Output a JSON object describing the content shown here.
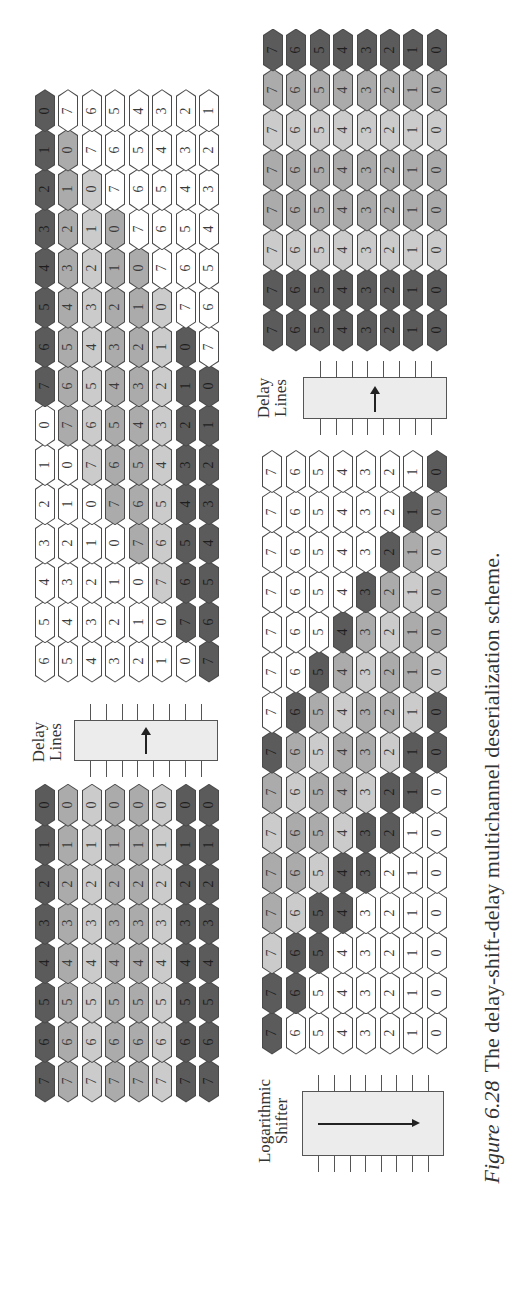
{
  "colors": {
    "dark": "#5b5b5b",
    "mid": "#ababab",
    "light": "#cbcbcb",
    "white": "#ffffff",
    "border": "#4a4a4a",
    "box_fill": "#ececec"
  },
  "labels": {
    "delay_lines_1": [
      "Delay",
      "Lines"
    ],
    "delay_lines_2": [
      "Delay",
      "Lines"
    ],
    "log_shifter": [
      "Logarithmic",
      "Shifter"
    ]
  },
  "caption": {
    "figure_number": "Figure 6.28",
    "text": "The delay-shift-delay multichannel deserialization scheme."
  },
  "chart_data": {
    "type": "diagram",
    "title": "The delay-shift-delay multichannel deserialization scheme.",
    "shade_legend": {
      "d": "dark",
      "m": "medium gray",
      "l": "light gray",
      "w": "white"
    },
    "stages": [
      {
        "name": "input",
        "rows": [
          {
            "values": [
              7,
              6,
              5,
              4,
              3,
              2,
              1,
              0
            ],
            "shades": [
              "d",
              "d",
              "d",
              "d",
              "d",
              "d",
              "d",
              "d"
            ]
          },
          {
            "values": [
              7,
              6,
              5,
              4,
              3,
              2,
              1,
              0
            ],
            "shades": [
              "m",
              "m",
              "m",
              "m",
              "m",
              "m",
              "m",
              "m"
            ]
          },
          {
            "values": [
              7,
              6,
              5,
              4,
              3,
              2,
              1,
              0
            ],
            "shades": [
              "l",
              "l",
              "l",
              "l",
              "l",
              "l",
              "l",
              "l"
            ]
          },
          {
            "values": [
              7,
              6,
              5,
              4,
              3,
              2,
              1,
              0
            ],
            "shades": [
              "m",
              "m",
              "m",
              "m",
              "m",
              "m",
              "m",
              "m"
            ]
          },
          {
            "values": [
              7,
              6,
              5,
              4,
              3,
              2,
              1,
              0
            ],
            "shades": [
              "m",
              "m",
              "m",
              "m",
              "m",
              "m",
              "m",
              "m"
            ]
          },
          {
            "values": [
              7,
              6,
              5,
              4,
              3,
              2,
              1,
              0
            ],
            "shades": [
              "l",
              "l",
              "l",
              "l",
              "l",
              "l",
              "l",
              "l"
            ]
          },
          {
            "values": [
              7,
              6,
              5,
              4,
              3,
              2,
              1,
              0
            ],
            "shades": [
              "d",
              "d",
              "d",
              "d",
              "d",
              "d",
              "d",
              "d"
            ]
          },
          {
            "values": [
              7,
              6,
              5,
              4,
              3,
              2,
              1,
              0
            ],
            "shades": [
              "d",
              "d",
              "d",
              "d",
              "d",
              "d",
              "d",
              "d"
            ]
          }
        ]
      },
      {
        "name": "delay_lines_output",
        "rows": [
          {
            "values": [
              6,
              5,
              4,
              3,
              2,
              1,
              0,
              7,
              6,
              5,
              4,
              3,
              2,
              1,
              0
            ],
            "shades": [
              "w",
              "w",
              "w",
              "w",
              "w",
              "w",
              "w",
              "d",
              "d",
              "d",
              "d",
              "d",
              "d",
              "d",
              "d"
            ]
          },
          {
            "values": [
              5,
              4,
              3,
              2,
              1,
              0,
              7,
              6,
              5,
              4,
              3,
              2,
              1,
              0,
              7
            ],
            "shades": [
              "w",
              "w",
              "w",
              "w",
              "w",
              "w",
              "m",
              "m",
              "m",
              "m",
              "m",
              "m",
              "m",
              "m",
              "w"
            ]
          },
          {
            "values": [
              4,
              3,
              2,
              1,
              0,
              7,
              6,
              5,
              4,
              3,
              2,
              1,
              0,
              7,
              6
            ],
            "shades": [
              "w",
              "w",
              "w",
              "w",
              "w",
              "l",
              "l",
              "l",
              "l",
              "l",
              "l",
              "l",
              "l",
              "w",
              "w"
            ]
          },
          {
            "values": [
              3,
              2,
              1,
              0,
              7,
              6,
              5,
              4,
              3,
              2,
              1,
              0,
              7,
              6,
              5
            ],
            "shades": [
              "w",
              "w",
              "w",
              "w",
              "m",
              "m",
              "m",
              "m",
              "m",
              "m",
              "m",
              "m",
              "w",
              "w",
              "w"
            ]
          },
          {
            "values": [
              2,
              1,
              0,
              7,
              6,
              5,
              4,
              3,
              2,
              1,
              0,
              7,
              6,
              5,
              4
            ],
            "shades": [
              "w",
              "w",
              "w",
              "m",
              "m",
              "m",
              "m",
              "m",
              "m",
              "m",
              "m",
              "w",
              "w",
              "w",
              "w"
            ]
          },
          {
            "values": [
              1,
              0,
              7,
              6,
              5,
              4,
              3,
              2,
              1,
              0,
              7,
              6,
              5,
              4,
              3
            ],
            "shades": [
              "w",
              "w",
              "l",
              "l",
              "l",
              "l",
              "l",
              "l",
              "l",
              "l",
              "w",
              "w",
              "w",
              "w",
              "w"
            ]
          },
          {
            "values": [
              0,
              7,
              6,
              5,
              4,
              3,
              2,
              1,
              0,
              7,
              6,
              5,
              4,
              3,
              2
            ],
            "shades": [
              "w",
              "d",
              "d",
              "d",
              "d",
              "d",
              "d",
              "d",
              "d",
              "w",
              "w",
              "w",
              "w",
              "w",
              "w"
            ]
          },
          {
            "values": [
              7,
              6,
              5,
              4,
              3,
              2,
              1,
              0,
              7,
              6,
              5,
              4,
              3,
              2,
              1
            ],
            "shades": [
              "d",
              "d",
              "d",
              "d",
              "d",
              "d",
              "d",
              "d",
              "w",
              "w",
              "w",
              "w",
              "w",
              "w",
              "w"
            ]
          }
        ]
      },
      {
        "name": "logarithmic_shifter_output",
        "rows": [
          {
            "values": [
              7,
              7,
              7,
              7,
              7,
              7,
              7,
              7,
              7,
              7,
              7,
              7,
              7,
              7,
              7
            ],
            "shades": [
              "d",
              "d",
              "l",
              "m",
              "m",
              "l",
              "m",
              "d",
              "w",
              "w",
              "w",
              "w",
              "w",
              "w",
              "w"
            ]
          },
          {
            "values": [
              6,
              6,
              6,
              6,
              6,
              6,
              6,
              6,
              6,
              6,
              6,
              6,
              6,
              6,
              6
            ],
            "shades": [
              "w",
              "d",
              "d",
              "l",
              "m",
              "m",
              "l",
              "m",
              "d",
              "w",
              "w",
              "w",
              "w",
              "w",
              "w"
            ]
          },
          {
            "values": [
              5,
              5,
              5,
              5,
              5,
              5,
              5,
              5,
              5,
              5,
              5,
              5,
              5,
              5,
              5
            ],
            "shades": [
              "w",
              "w",
              "d",
              "d",
              "l",
              "m",
              "m",
              "l",
              "m",
              "d",
              "w",
              "w",
              "w",
              "w",
              "w"
            ]
          },
          {
            "values": [
              4,
              4,
              4,
              4,
              4,
              4,
              4,
              4,
              4,
              4,
              4,
              4,
              4,
              4,
              4
            ],
            "shades": [
              "w",
              "w",
              "w",
              "d",
              "d",
              "l",
              "m",
              "m",
              "l",
              "m",
              "d",
              "w",
              "w",
              "w",
              "w"
            ]
          },
          {
            "values": [
              3,
              3,
              3,
              3,
              3,
              3,
              3,
              3,
              3,
              3,
              3,
              3,
              3,
              3,
              3
            ],
            "shades": [
              "w",
              "w",
              "w",
              "w",
              "d",
              "d",
              "l",
              "m",
              "m",
              "l",
              "m",
              "d",
              "w",
              "w",
              "w"
            ]
          },
          {
            "values": [
              2,
              2,
              2,
              2,
              2,
              2,
              2,
              2,
              2,
              2,
              2,
              2,
              2,
              2,
              2
            ],
            "shades": [
              "w",
              "w",
              "w",
              "w",
              "w",
              "d",
              "d",
              "l",
              "m",
              "m",
              "l",
              "m",
              "d",
              "w",
              "w"
            ]
          },
          {
            "values": [
              1,
              1,
              1,
              1,
              1,
              1,
              1,
              1,
              1,
              1,
              1,
              1,
              1,
              1,
              1
            ],
            "shades": [
              "w",
              "w",
              "w",
              "w",
              "w",
              "w",
              "d",
              "d",
              "l",
              "m",
              "m",
              "l",
              "m",
              "d",
              "w"
            ]
          },
          {
            "values": [
              0,
              0,
              0,
              0,
              0,
              0,
              0,
              0,
              0,
              0,
              0,
              0,
              0,
              0,
              0
            ],
            "shades": [
              "w",
              "w",
              "w",
              "w",
              "w",
              "w",
              "w",
              "d",
              "d",
              "l",
              "m",
              "m",
              "l",
              "m",
              "d"
            ]
          }
        ]
      },
      {
        "name": "output",
        "rows": [
          {
            "values": [
              7,
              7,
              7,
              7,
              7,
              7,
              7,
              7
            ],
            "shades": [
              "d",
              "d",
              "l",
              "m",
              "m",
              "l",
              "m",
              "d"
            ]
          },
          {
            "values": [
              6,
              6,
              6,
              6,
              6,
              6,
              6,
              6
            ],
            "shades": [
              "d",
              "d",
              "l",
              "m",
              "m",
              "l",
              "m",
              "d"
            ]
          },
          {
            "values": [
              5,
              5,
              5,
              5,
              5,
              5,
              5,
              5
            ],
            "shades": [
              "d",
              "d",
              "l",
              "m",
              "m",
              "l",
              "m",
              "d"
            ]
          },
          {
            "values": [
              4,
              4,
              4,
              4,
              4,
              4,
              4,
              4
            ],
            "shades": [
              "d",
              "d",
              "l",
              "m",
              "m",
              "l",
              "m",
              "d"
            ]
          },
          {
            "values": [
              3,
              3,
              3,
              3,
              3,
              3,
              3,
              3
            ],
            "shades": [
              "d",
              "d",
              "l",
              "m",
              "m",
              "l",
              "m",
              "d"
            ]
          },
          {
            "values": [
              2,
              2,
              2,
              2,
              2,
              2,
              2,
              2
            ],
            "shades": [
              "d",
              "d",
              "l",
              "m",
              "m",
              "l",
              "m",
              "d"
            ]
          },
          {
            "values": [
              1,
              1,
              1,
              1,
              1,
              1,
              1,
              1
            ],
            "shades": [
              "d",
              "d",
              "l",
              "m",
              "m",
              "l",
              "m",
              "d"
            ]
          },
          {
            "values": [
              0,
              0,
              0,
              0,
              0,
              0,
              0,
              0
            ],
            "shades": [
              "d",
              "d",
              "l",
              "m",
              "m",
              "l",
              "m",
              "d"
            ]
          }
        ]
      }
    ],
    "blocks": [
      {
        "name": "Delay Lines",
        "between": [
          "input",
          "delay_lines_output"
        ],
        "arrow": "right"
      },
      {
        "name": "Logarithmic Shifter",
        "between": [
          "delay_lines_output",
          "logarithmic_shifter_output"
        ],
        "arrow": "down"
      },
      {
        "name": "Delay Lines",
        "between": [
          "logarithmic_shifter_output",
          "output"
        ],
        "arrow": "right"
      }
    ]
  }
}
